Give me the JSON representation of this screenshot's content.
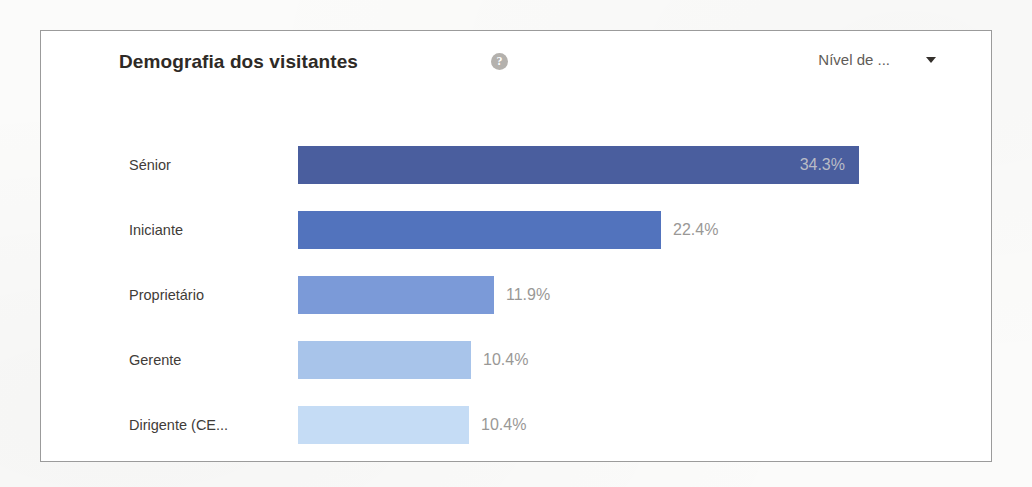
{
  "card": {
    "title": "Demografia dos visitantes",
    "help_icon": "help-circle-icon",
    "selector": {
      "label": "Nível de ...",
      "caret_icon": "chevron-down-icon"
    }
  },
  "chart_data": {
    "type": "bar",
    "orientation": "horizontal",
    "title": "Demografia dos visitantes",
    "xlabel": "",
    "ylabel": "",
    "grid": false,
    "legend": "none",
    "categories": [
      "Sénior",
      "Iniciante",
      "Proprietário",
      "Gerente",
      "Dirigente (CE..."
    ],
    "values": [
      34.3,
      22.4,
      11.9,
      10.4,
      10.4
    ],
    "value_labels": [
      "34.3%",
      "22.4%",
      "11.9%",
      "10.4%",
      "10.4%"
    ],
    "label_placement": [
      "inside",
      "outside",
      "outside",
      "outside",
      "outside"
    ],
    "bar_colors": [
      "#4a5e9e",
      "#5273bd",
      "#7b9ad8",
      "#a8c4ea",
      "#c5dcf5"
    ],
    "xlim": [
      0,
      36.5
    ],
    "bar_pixel_widths": [
      561,
      363,
      196,
      173,
      171
    ]
  }
}
